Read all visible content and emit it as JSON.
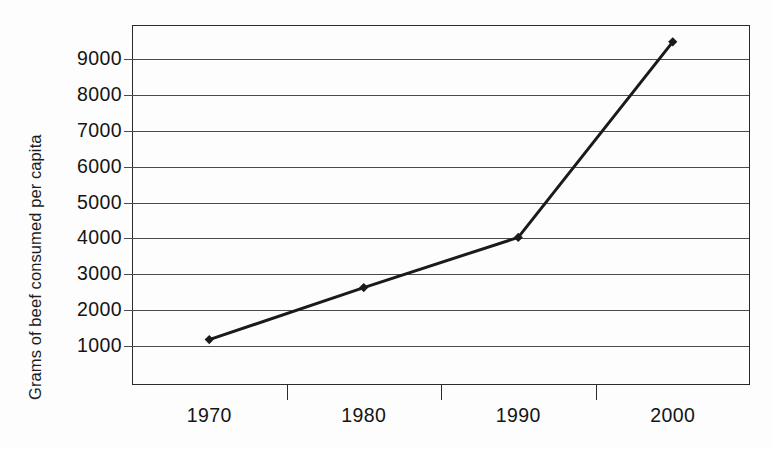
{
  "chart_data": {
    "type": "line",
    "title": "",
    "xlabel": "",
    "ylabel": "Grams of beef consumed per capita",
    "categories": [
      "1970",
      "1980",
      "1990",
      "2000"
    ],
    "values": [
      1150,
      2600,
      4000,
      9450
    ],
    "series": [
      {
        "name": "Grams of beef consumed per capita",
        "values": [
          1150,
          2600,
          4000,
          9450
        ]
      }
    ],
    "ylim": [
      0,
      9950
    ],
    "y_ticks": [
      1000,
      2000,
      3000,
      4000,
      5000,
      6000,
      7000,
      8000,
      9000
    ],
    "y_tick_labels": [
      "1000",
      "2000",
      "3000",
      "4000",
      "5000",
      "6000",
      "7000",
      "8000",
      "9000"
    ],
    "x_tick_labels": [
      "1970",
      "1980",
      "1990",
      "2000"
    ],
    "grid": true,
    "grid_axis": "y",
    "legend": false,
    "legend_position": "none",
    "marker": "diamond",
    "line_color": "#1a1a1a",
    "marker_color": "#1a1a1a",
    "grid_color": "#4a4a4a",
    "axis_color": "#2a2a2a",
    "background_color": "#fdfdfd",
    "text_color": "#141414"
  },
  "axes": {
    "y_title": "Grams of beef consumed per capita"
  }
}
